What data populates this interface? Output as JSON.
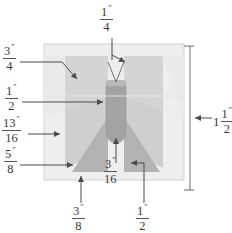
{
  "figure": {
    "type": "engineering-dimension-diagram",
    "units": "inches",
    "colors": {
      "plate_fill": "#eeeeee",
      "wing_light": "#d9d9d9",
      "wing_mid": "#cfcfcf",
      "slot_fill": "#a8a8a8",
      "triangle_fill": "#b5b5b5",
      "outline": "#c8c8c8",
      "leader": "#4a4a4a",
      "text": "#3a3a3a"
    }
  },
  "dimensions": {
    "top": {
      "id": "slot-top-width",
      "whole": "",
      "numerator": "1",
      "denominator": "4",
      "inch_mark": "″",
      "value": 0.25,
      "label": "1/4\""
    },
    "left_1": {
      "id": "upper-taper-depth",
      "whole": "",
      "numerator": "3",
      "denominator": "4",
      "inch_mark": "″",
      "value": 0.75,
      "label": "3/4\""
    },
    "left_2": {
      "id": "slot-width",
      "whole": "",
      "numerator": "1",
      "denominator": "2",
      "inch_mark": "″",
      "value": 0.5,
      "label": "1/2\""
    },
    "left_3": {
      "id": "side-flat-height",
      "whole": "",
      "numerator": "13",
      "denominator": "16",
      "inch_mark": "″",
      "value": 0.8125,
      "label": "13/16\""
    },
    "left_4": {
      "id": "lower-taper-height",
      "whole": "",
      "numerator": "5",
      "denominator": "8",
      "inch_mark": "″",
      "value": 0.625,
      "label": "5/8\""
    },
    "center": {
      "id": "slot-root-radius",
      "whole": "",
      "numerator": "3",
      "denominator": "16",
      "inch_mark": "″",
      "value": 0.1875,
      "label": "3/16\""
    },
    "right": {
      "id": "overall-height",
      "whole": "1",
      "numerator": "1",
      "denominator": "2",
      "inch_mark": "″",
      "value": 1.5,
      "label": "1 1/2\""
    },
    "bottom_1": {
      "id": "bottom-triangle-base",
      "whole": "",
      "numerator": "3",
      "denominator": "8",
      "inch_mark": "″",
      "value": 0.375,
      "label": "3/8\""
    },
    "bottom_2": {
      "id": "right-triangle-offset",
      "whole": "",
      "numerator": "1",
      "denominator": "2",
      "inch_mark": "″",
      "value": 0.5,
      "label": "1/2\""
    }
  }
}
